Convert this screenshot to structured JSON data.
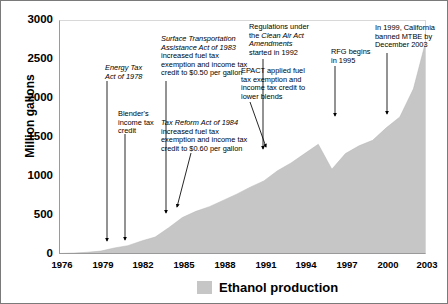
{
  "chart_data": {
    "type": "area",
    "title": "",
    "xlabel": "",
    "ylabel": "Million gallons",
    "ylim": [
      0,
      3000
    ],
    "xlim": [
      1976,
      2003
    ],
    "yticks": [
      0,
      500,
      1000,
      1500,
      2000,
      2500,
      3000
    ],
    "xticks": [
      1976,
      1979,
      1982,
      1985,
      1988,
      1991,
      1994,
      1997,
      2000,
      2003
    ],
    "grid": false,
    "legend_position": "bottom",
    "series": [
      {
        "name": "Ethanol production",
        "color": "#c6c6c6",
        "x": [
          1976,
          1977,
          1978,
          1979,
          1980,
          1981,
          1982,
          1983,
          1984,
          1985,
          1986,
          1987,
          1988,
          1989,
          1990,
          1991,
          1992,
          1993,
          1994,
          1995,
          1996,
          1997,
          1998,
          1999,
          2000,
          2001,
          2002,
          2003
        ],
        "values": [
          20,
          25,
          35,
          50,
          90,
          120,
          180,
          230,
          350,
          480,
          560,
          620,
          700,
          780,
          870,
          950,
          1080,
          1180,
          1300,
          1420,
          1100,
          1300,
          1400,
          1470,
          1630,
          1770,
          2130,
          2800
        ]
      }
    ],
    "annotations": [
      {
        "id": "energy-tax-act",
        "lines": [
          {
            "text": "Energy Tax",
            "italic": true
          },
          {
            "text": "Act of 1978",
            "italic": true
          }
        ],
        "arrow_to_year": 1978
      },
      {
        "id": "blenders-credit",
        "lines": [
          {
            "text": "Blender's",
            "italic": false
          },
          {
            "text": "income tax",
            "italic": false
          },
          {
            "text": "credit",
            "italic": false
          }
        ],
        "arrow_to_year": 1980
      },
      {
        "id": "surface-transportation-act",
        "lines": [
          {
            "text": "Surface Transportation",
            "italic": true
          },
          {
            "text": "Assistance Act of 1983",
            "italic": true
          },
          {
            "text": "increased fuel tax",
            "italic": false
          },
          {
            "text": "exemption and income tax",
            "italic": false
          },
          {
            "text": "credit to $0.50 per gallon",
            "italic": false
          }
        ],
        "arrow_to_year": 1983
      },
      {
        "id": "tax-reform-act",
        "lines": [
          {
            "text": "Tax Reform Act of 1984",
            "italic": true
          },
          {
            "text": "increased fuel tax",
            "italic": false
          },
          {
            "text": "exemption and income tax",
            "italic": false
          },
          {
            "text": "credit to $0.60 per gallon",
            "italic": false
          }
        ],
        "arrow_to_year": 1984
      },
      {
        "id": "epact",
        "lines": [
          {
            "text": "EPACT applied fuel",
            "italic": false
          },
          {
            "text": "tax exemption and",
            "italic": false
          },
          {
            "text": "income tax credit to",
            "italic": false
          },
          {
            "text": "lower blends",
            "italic": false
          }
        ],
        "arrow_to_year": 1992
      },
      {
        "id": "clean-air-act-amendments",
        "lines": [
          {
            "text": "Regulations under",
            "italic": false
          },
          {
            "text": "the Clean Air Act",
            "italic": false
          },
          {
            "text": "Amendments",
            "italic": true
          },
          {
            "text": "started in 1992",
            "italic": false
          }
        ],
        "arrow_to_year": 1992
      },
      {
        "id": "rfg-begins",
        "lines": [
          {
            "text": "RFG begins",
            "italic": false
          },
          {
            "text": "in 1995",
            "italic": false
          }
        ],
        "arrow_to_year": 1995
      },
      {
        "id": "california-mtbe-ban",
        "lines": [
          {
            "text": "In 1999, California",
            "italic": false
          },
          {
            "text": "banned MTBE by",
            "italic": false
          },
          {
            "text": "December 2003",
            "italic": false
          }
        ],
        "arrow_to_year": 1999
      }
    ]
  },
  "axis": {
    "ylabel": "Million gallons",
    "yticks": [
      "3000",
      "2500",
      "2000",
      "1500",
      "1000",
      "500",
      "0"
    ],
    "xticks": [
      "1976",
      "1979",
      "1982",
      "1985",
      "1988",
      "1991",
      "1994",
      "1997",
      "2000",
      "2003"
    ]
  },
  "legend": {
    "label": "Ethanol production",
    "color": "#c6c6c6"
  },
  "annotations": {
    "energy": {
      "l1": "Energy Tax",
      "l2": "Act of 1978"
    },
    "blender": {
      "l1": "Blender's",
      "l2": "income tax",
      "l3": "credit"
    },
    "surface": {
      "l1": "Surface Transportation",
      "l2": "Assistance Act of 1983",
      "l3": "increased fuel tax",
      "l4": "exemption and income tax",
      "l5": "credit to $0.50 per gallon"
    },
    "taxreform": {
      "l1": "Tax Reform Act of 1984",
      "l2": "increased fuel tax",
      "l3": "exemption and income tax",
      "l4": "credit to $0.60 per gallon"
    },
    "epact": {
      "l1": "EPACT applied fuel",
      "l2": "tax exemption and",
      "l3": "income tax credit to",
      "l4": "lower blends"
    },
    "caa": {
      "l1": "Regulations under",
      "l2a": "the ",
      "l2b": "Clean Air Act",
      "l3": "Amendments",
      "l4": "started in 1992"
    },
    "rfg": {
      "l1": "RFG begins",
      "l2": "in 1995"
    },
    "mtbe": {
      "l1": "In 1999, California",
      "l2": "banned MTBE by",
      "l3": "December 2003"
    }
  }
}
